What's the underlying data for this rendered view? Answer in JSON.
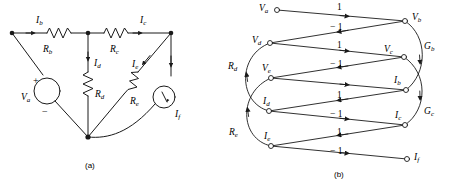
{
  "figure": {
    "caption_a": "(a)",
    "caption_b": "(b)"
  },
  "circuit": {
    "name": "resistive-network",
    "currents": [
      {
        "id": "Ib",
        "base": "I",
        "sub": "b",
        "x": 36,
        "y": 16
      },
      {
        "id": "Ic",
        "base": "I",
        "sub": "c",
        "x": 140,
        "y": 16
      },
      {
        "id": "Id",
        "base": "I",
        "sub": "d",
        "x": 94,
        "y": 59
      },
      {
        "id": "Ie",
        "base": "I",
        "sub": "e",
        "x": 132,
        "y": 60
      },
      {
        "id": "If",
        "base": "I",
        "sub": "f",
        "x": 175,
        "y": 110
      }
    ],
    "resistors": [
      {
        "id": "Rb",
        "base": "R",
        "sub": "b",
        "x": 43,
        "y": 45
      },
      {
        "id": "Rc",
        "base": "R",
        "sub": "c",
        "x": 110,
        "y": 45
      },
      {
        "id": "Rd",
        "base": "R",
        "sub": "d",
        "x": 95,
        "y": 90
      },
      {
        "id": "Re",
        "base": "R",
        "sub": "e",
        "x": 130,
        "y": 97
      }
    ],
    "source": {
      "id": "Va",
      "base": "V",
      "sub": "a",
      "label_x": 21,
      "label_y": 93,
      "plus": "+",
      "plus_x": 33,
      "plus_y": 76,
      "minus": "−",
      "minus_x": 42,
      "minus_y": 107
    }
  },
  "graph": {
    "name": "signal-flow-graph",
    "nodes": [
      {
        "id": "Va",
        "base": "V",
        "sub": "a",
        "cx": 277,
        "cy": 10,
        "label_x": 259,
        "label_y": 4,
        "side": "left"
      },
      {
        "id": "Vd",
        "base": "V",
        "sub": "d",
        "cx": 270,
        "cy": 43,
        "label_x": 252,
        "label_y": 36,
        "side": "left"
      },
      {
        "id": "Ve",
        "base": "V",
        "sub": "e",
        "cx": 271,
        "cy": 78,
        "label_x": 262,
        "label_y": 64,
        "side": "left"
      },
      {
        "id": "Id",
        "base": "I",
        "sub": "d",
        "cx": 269,
        "cy": 111,
        "label_x": 263,
        "label_y": 97,
        "side": "left"
      },
      {
        "id": "Ie",
        "base": "I",
        "sub": "e",
        "cx": 271,
        "cy": 146,
        "label_x": 264,
        "label_y": 132,
        "side": "left"
      },
      {
        "id": "Vb",
        "base": "V",
        "sub": "b",
        "cx": 405,
        "cy": 21,
        "label_x": 412,
        "label_y": 13,
        "side": "right"
      },
      {
        "id": "Vc",
        "base": "V",
        "sub": "c",
        "cx": 404,
        "cy": 57,
        "label_x": 384,
        "label_y": 45,
        "side": "right"
      },
      {
        "id": "Ib",
        "base": "I",
        "sub": "b",
        "cx": 406,
        "cy": 90,
        "label_x": 394,
        "label_y": 76,
        "side": "right"
      },
      {
        "id": "Ic",
        "base": "I",
        "sub": "c",
        "cx": 405,
        "cy": 125,
        "label_x": 395,
        "label_y": 111,
        "side": "right"
      },
      {
        "id": "If",
        "base": "I",
        "sub": "f",
        "cx": 407,
        "cy": 159,
        "label_x": 414,
        "label_y": 153,
        "side": "right"
      }
    ],
    "edge_gains": [
      {
        "value": "1",
        "x": 337,
        "y": 3
      },
      {
        "value": "− 1",
        "x": 330,
        "y": 23
      },
      {
        "value": "1",
        "x": 337,
        "y": 41
      },
      {
        "value": "− 1",
        "x": 330,
        "y": 60
      },
      {
        "value": "1",
        "x": 337,
        "y": 91
      },
      {
        "value": "− 1",
        "x": 330,
        "y": 110
      },
      {
        "value": "1",
        "x": 337,
        "y": 128
      },
      {
        "value": "− 1",
        "x": 330,
        "y": 147
      }
    ],
    "arc_gains": [
      {
        "id": "Rd",
        "base": "R",
        "sub": "d",
        "x": 228,
        "y": 62
      },
      {
        "id": "Re",
        "base": "R",
        "sub": "e",
        "x": 229,
        "y": 128
      },
      {
        "id": "Gb",
        "base": "G",
        "sub": "b",
        "x": 424,
        "y": 42
      },
      {
        "id": "Gc",
        "base": "G",
        "sub": "c",
        "x": 424,
        "y": 107
      }
    ]
  },
  "colors": {
    "stroke": "#1a1a1a",
    "background": "#ffffff"
  }
}
